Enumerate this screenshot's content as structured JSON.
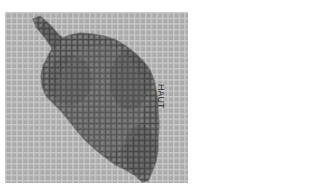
{
  "image": {
    "description": "Grayscale photo of a leaf shape embroidered / stitched onto grid canvas fabric",
    "subject": "leaf-stitch-pattern",
    "orientation_label": "HAUT",
    "colors": {
      "page_background": "#ffffff",
      "fabric_base": "#a9a9a9",
      "fabric_grid_line": "#c9c9c9",
      "stitch_dark": "#454545",
      "stitch_mid": "#6a6a6a",
      "stitch_light": "#858585",
      "label_text": "#2a2a2a"
    }
  }
}
